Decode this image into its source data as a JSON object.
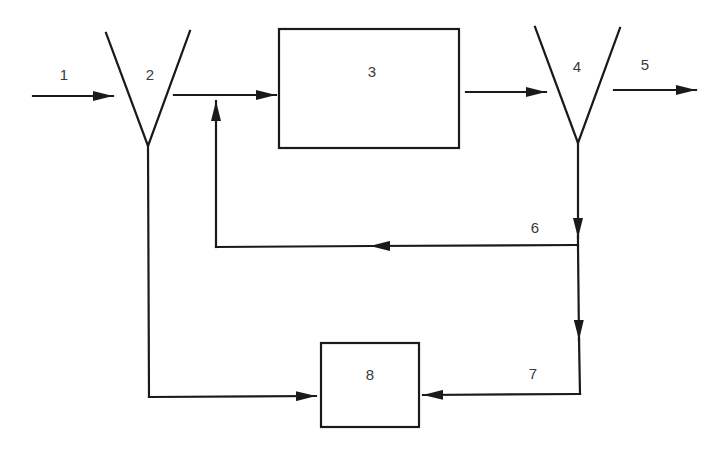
{
  "diagram": {
    "type": "process-flow-block-diagram",
    "stroke_color": "#1a1a1a",
    "label_color": "#3a3a3a",
    "background": "#ffffff",
    "labels": {
      "stream_1": "1",
      "separator_2": "2",
      "unit_3": "3",
      "separator_4": "4",
      "stream_5": "5",
      "stream_6": "6",
      "stream_7": "7",
      "unit_8": "8"
    },
    "nodes": [
      {
        "id": "2",
        "shape": "funnel",
        "label": "2"
      },
      {
        "id": "3",
        "shape": "rectangle",
        "label": "3"
      },
      {
        "id": "4",
        "shape": "funnel",
        "label": "4"
      },
      {
        "id": "8",
        "shape": "rectangle",
        "label": "8"
      }
    ],
    "edges": [
      {
        "label": "1",
        "from": "input",
        "to": "2"
      },
      {
        "label": "",
        "from": "2",
        "to": "3"
      },
      {
        "label": "",
        "from": "3",
        "to": "4"
      },
      {
        "label": "5",
        "from": "4",
        "to": "output"
      },
      {
        "label": "6",
        "from": "4",
        "to": "3",
        "note": "recycle joins 2→3 line"
      },
      {
        "label": "7",
        "from": "4",
        "to": "8"
      },
      {
        "label": "",
        "from": "2",
        "to": "8"
      }
    ]
  }
}
